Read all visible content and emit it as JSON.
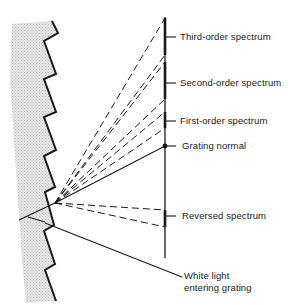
{
  "diagram": {
    "labels": {
      "third_order": "Third-order spectrum",
      "second_order": "Second-order spectrum",
      "first_order": "First-order spectrum",
      "grating_normal": "Grating normal",
      "reversed": "Reversed spectrum",
      "white_light_line1": "White light",
      "white_light_line2": "entering grating"
    },
    "colors": {
      "ink": "#1a1a1a",
      "grating_fill": "#d9d9d9",
      "background": "#ffffff"
    }
  }
}
